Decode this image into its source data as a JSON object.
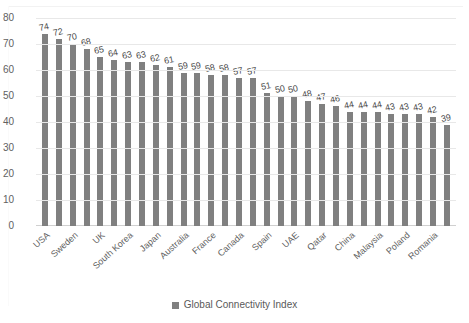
{
  "chart_data": {
    "type": "bar",
    "title": "",
    "subtitle": "",
    "xlabel": "",
    "ylabel": "",
    "ylim": [
      0,
      80
    ],
    "ytick_step": 10,
    "yticks": [
      80,
      70,
      60,
      50,
      40,
      30,
      20,
      10,
      0
    ],
    "grid": true,
    "legend_position": "bottom",
    "series": [
      {
        "name": "Global Connectivity Index",
        "color": "#808080",
        "values": [
          74,
          72,
          70,
          68,
          65,
          64,
          63,
          63,
          62,
          61,
          59,
          59,
          58,
          58,
          57,
          57,
          51,
          50,
          50,
          48,
          47,
          46,
          44,
          44,
          44,
          43,
          43,
          43,
          42,
          39
        ]
      }
    ],
    "categories": [
      "USA",
      "",
      "Sweden",
      "",
      "UK",
      "",
      "South Korea",
      "",
      "Japan",
      "",
      "Australia",
      "",
      "France",
      "",
      "Canada",
      "",
      "Spain",
      "",
      "UAE",
      "",
      "Qatar",
      "",
      "China",
      "",
      "Malaysia",
      "",
      "Poland",
      "",
      "Romania",
      ""
    ],
    "data_labels": [
      "74",
      "72",
      "70",
      "68",
      "65",
      "64",
      "63",
      "63",
      "62",
      "61",
      "59",
      "59",
      "58",
      "58",
      "57",
      "57",
      "51",
      "50",
      "50",
      "48",
      "47",
      "46",
      "44",
      "44",
      "44",
      "43",
      "43",
      "43",
      "42",
      "39"
    ],
    "visible_category_labels": [
      "USA",
      "Sweden",
      "UK",
      "South Korea",
      "Japan",
      "Australia",
      "France",
      "Canada",
      "Spain",
      "UAE",
      "Qatar",
      "China",
      "Malaysia",
      "Poland",
      "Romania"
    ]
  },
  "legend": {
    "items": [
      {
        "label": "Global Connectivity Index",
        "color": "#808080"
      }
    ]
  },
  "colors": {
    "bar": "#808080",
    "gridline": "#e8e8e8",
    "axis_text": "#616161",
    "label_text": "#4d4d4d",
    "background": "#ffffff"
  }
}
